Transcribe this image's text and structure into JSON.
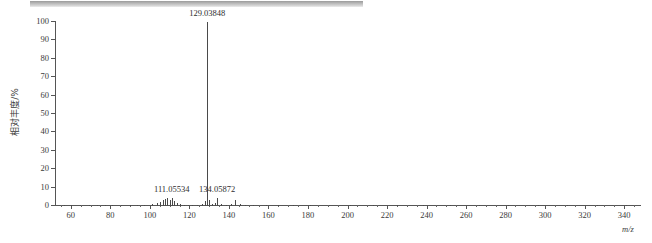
{
  "chart_data": {
    "type": "bar",
    "title": "",
    "xlabel": "m/z",
    "ylabel": "相对丰度/%",
    "xlim": [
      52,
      348
    ],
    "ylim": [
      0,
      100
    ],
    "grid": false,
    "legend": "none",
    "xticks": [
      60,
      80,
      100,
      120,
      140,
      160,
      180,
      200,
      220,
      240,
      260,
      280,
      300,
      320,
      340
    ],
    "xtick_labels": [
      "60",
      "80",
      "100",
      "120",
      "140",
      "160",
      "180",
      "200",
      "220",
      "240",
      "260",
      "280",
      "300",
      "320",
      "340"
    ],
    "yticks": [
      0,
      10,
      20,
      30,
      40,
      50,
      60,
      70,
      80,
      90,
      100
    ],
    "ytick_labels": [
      "0",
      "10",
      "20",
      "30",
      "40",
      "50",
      "60",
      "70",
      "80",
      "90",
      "100"
    ],
    "x": [
      56.5,
      60.2,
      64.8,
      69.3,
      73.1,
      77.4,
      81.0,
      85.6,
      89.9,
      93.4,
      97.2,
      101.0,
      103.5,
      105.2,
      106.4,
      107.6,
      108.8,
      110.0,
      111.05534,
      112.3,
      113.6,
      115.0,
      117.2,
      119.4,
      121.5,
      124.0,
      126.3,
      127.8,
      129.03848,
      130.1,
      131.4,
      133.0,
      134.05872,
      136.2,
      138.5,
      141.0,
      143.2,
      145.4,
      148.0,
      152.3,
      158.6,
      165.0,
      172.4,
      181.0,
      190.5,
      201.2,
      212.8,
      225.0,
      238.4,
      252.0,
      266.5,
      281.0,
      296.2,
      311.0,
      326.4,
      340.8
    ],
    "values": [
      0.6,
      0.4,
      0.7,
      0.5,
      0.6,
      0.4,
      0.8,
      0.5,
      0.6,
      0.4,
      0.7,
      1.1,
      1.5,
      2.4,
      3.0,
      3.6,
      4.1,
      3.3,
      4.6,
      2.6,
      1.8,
      1.3,
      0.8,
      0.6,
      0.5,
      0.7,
      1.0,
      2.8,
      100.0,
      3.2,
      0.9,
      1.4,
      4.3,
      1.1,
      0.8,
      1.2,
      3.5,
      1.0,
      0.6,
      0.5,
      0.4,
      0.5,
      0.4,
      0.5,
      0.4,
      0.5,
      0.4,
      0.4,
      0.5,
      0.4,
      0.4,
      0.5,
      0.4,
      0.4,
      0.5,
      0.4
    ],
    "annotations": [
      {
        "name": "peak-label-129",
        "text": "129.03848",
        "x": 129.03848,
        "y": 100.0
      },
      {
        "name": "peak-label-111",
        "text": "111.05534",
        "x": 111.05534,
        "y": 4.6
      },
      {
        "name": "peak-label-134",
        "text": "134.05872",
        "x": 134.05872,
        "y": 4.3
      }
    ]
  },
  "axis": {
    "x_title": "m/z",
    "y_title": "相对丰度/%"
  },
  "colors": {
    "peak": "#4a4a4a",
    "axis": "#555555",
    "text": "#3a3a3a",
    "strip": "#b6b6b6"
  }
}
